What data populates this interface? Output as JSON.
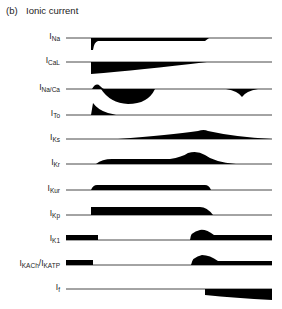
{
  "figure": {
    "panel_label": "(b)",
    "title": "Ionic current"
  },
  "traces": [
    {
      "main": "I",
      "sub": "Na",
      "y": 38
    },
    {
      "main": "I",
      "sub": "CaL",
      "y": 62
    },
    {
      "main": "I",
      "sub": "Na/Ca",
      "y": 89
    },
    {
      "main": "I",
      "sub": "To",
      "y": 115
    },
    {
      "main": "I",
      "sub": "Ks",
      "y": 139
    },
    {
      "main": "I",
      "sub": "Kr",
      "y": 164
    },
    {
      "main": "I",
      "sub": "Kur",
      "y": 190
    },
    {
      "main": "I",
      "sub": "Kp",
      "y": 215
    },
    {
      "main": "I",
      "sub": "K1",
      "y": 240
    },
    {
      "main": "I",
      "sub": "KACh",
      "main2": "/I",
      "sub2": "KATP",
      "y": 265
    },
    {
      "main": "I",
      "sub": "f",
      "y": 289
    }
  ],
  "colors": {
    "trace_fill": "#000000",
    "baseline": "#333333",
    "text": "#222222"
  }
}
